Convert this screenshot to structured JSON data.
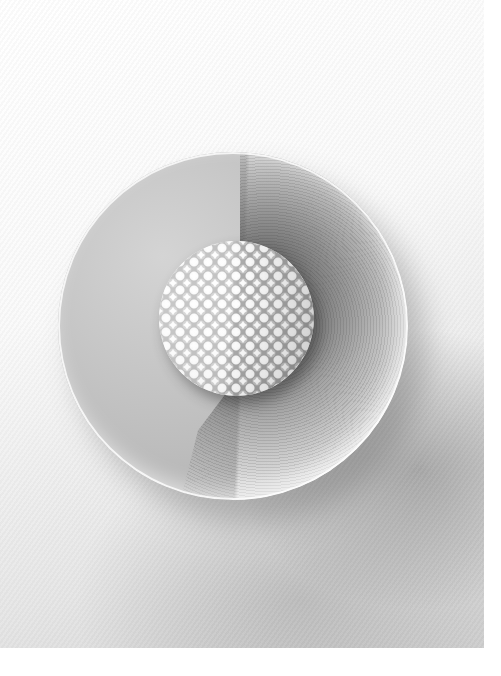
{
  "image": {
    "subject": "textured white sphere dessert in a round bowl dusted with dark powder",
    "colors": {
      "page_background": "#ffffff",
      "bowl_light": "#d4d4d4",
      "bowl_shadow": "#a8a8a8",
      "powder": "#464646",
      "sphere_highlight": "#ffffff",
      "cast_shadow": "#8a8a8a"
    }
  }
}
